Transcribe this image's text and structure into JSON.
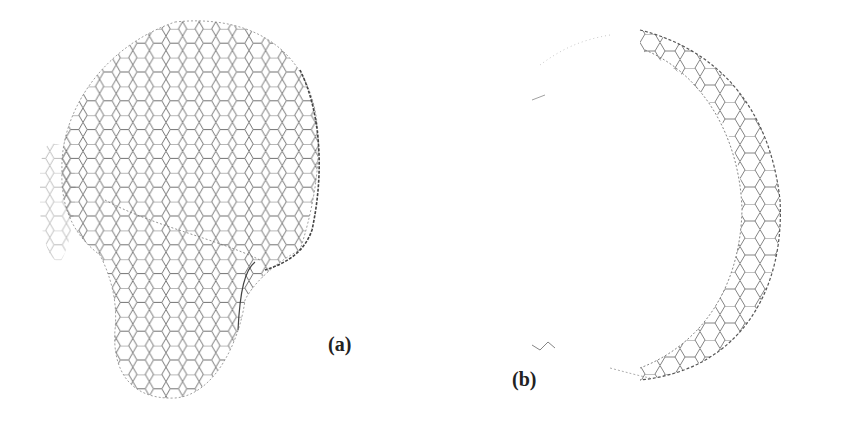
{
  "figure": {
    "panels": [
      {
        "id": "a",
        "label": "(a)",
        "description": "hexagonal lattice closed structure (bulbous shell)"
      },
      {
        "id": "b",
        "label": "(b)",
        "description": "hexagonal lattice crescent cross-section"
      }
    ],
    "colors": {
      "background": "#ffffff",
      "lattice": "#555555",
      "label": "#222222"
    }
  }
}
